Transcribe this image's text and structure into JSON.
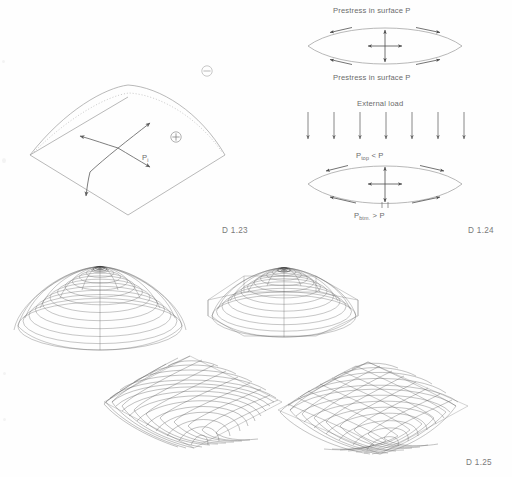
{
  "page": {
    "background_color": "#fefefe",
    "line_color": "#8a8a8a",
    "text_color": "#6e6e6e",
    "mesh_color": "#5a5a5a"
  },
  "figures": {
    "membrane_surface": {
      "caption": "D 1.23",
      "pressure_label": "P",
      "pressure_subscript": "i",
      "positive_symbol": "⊕",
      "negative_symbol": "⊖",
      "description": "Anticlastic membrane surface with principal curvature arrows"
    },
    "prestress": {
      "caption": "D 1.24",
      "top_label": "Prestress in surface P",
      "bottom_label": "Prestress in surface P",
      "external_load_label": "External load",
      "load_arrow_count": 7,
      "loaded_top_label_prefix": "P",
      "loaded_top_label_sub": "top",
      "loaded_top_label_suffix": " < P",
      "loaded_bottom_label_prefix": "P",
      "loaded_bottom_label_sub": "btm.",
      "loaded_bottom_label_suffix": " > P"
    },
    "shell_renderings": {
      "caption": "D 1.25",
      "items": [
        {
          "name": "radial-dome",
          "mesh": "polar",
          "plan": "circular"
        },
        {
          "name": "polygonal-base-dome",
          "mesh": "polar",
          "plan": "octagonal"
        },
        {
          "name": "square-plan-grid-dome",
          "mesh": "orthogonal-grid",
          "plan": "square"
        },
        {
          "name": "triangulated-dome",
          "mesh": "triangulated",
          "plan": "square"
        }
      ]
    }
  }
}
